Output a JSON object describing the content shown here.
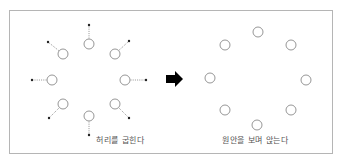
{
  "diagram": {
    "left_panel": {
      "caption": "허리를 굽힌다",
      "circles": [
        {
          "x": 89,
          "y": 44,
          "dx": 89,
          "dy": 25
        },
        {
          "x": 63,
          "y": 54,
          "dx": 48,
          "dy": 42
        },
        {
          "x": 115,
          "y": 54,
          "dx": 129,
          "dy": 41
        },
        {
          "x": 52,
          "y": 80,
          "dx": 32,
          "dy": 80
        },
        {
          "x": 125,
          "y": 80,
          "dx": 146,
          "dy": 80
        },
        {
          "x": 63,
          "y": 104,
          "dx": 49,
          "dy": 118
        },
        {
          "x": 115,
          "y": 104,
          "dx": 129,
          "dy": 118
        },
        {
          "x": 89,
          "y": 116,
          "dx": 89,
          "dy": 135
        }
      ]
    },
    "arrow": {
      "direction": "right",
      "color": "#000000"
    },
    "right_panel": {
      "caption": "원안을 보며 앉는다",
      "circles": [
        {
          "x": 258,
          "y": 32
        },
        {
          "x": 225,
          "y": 45
        },
        {
          "x": 291,
          "y": 45
        },
        {
          "x": 210,
          "y": 78
        },
        {
          "x": 306,
          "y": 80
        },
        {
          "x": 225,
          "y": 110
        },
        {
          "x": 291,
          "y": 110
        },
        {
          "x": 257,
          "y": 125
        }
      ]
    },
    "colors": {
      "circle_stroke": "#8a8a8a",
      "frame": "#b5b5b5",
      "dot": "#222222"
    }
  }
}
